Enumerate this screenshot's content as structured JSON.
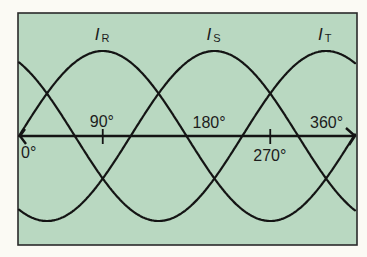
{
  "diagram": {
    "colors": {
      "background": "#fbfaf4",
      "panel": "#b9d8c1",
      "line": "#141414",
      "text": "#1c1c1c"
    },
    "axis": {
      "unit": "°",
      "degree_symbol": "°",
      "range_deg": [
        0,
        360
      ],
      "ticks": [
        {
          "deg": 0,
          "label": "0°",
          "label_pos": "below"
        },
        {
          "deg": 90,
          "label": "90°",
          "label_pos": "above"
        },
        {
          "deg": 180,
          "label": "180°",
          "label_pos": "above"
        },
        {
          "deg": 270,
          "label": "270°",
          "label_pos": "below"
        },
        {
          "deg": 360,
          "label": "360°",
          "label_pos": "above"
        }
      ]
    },
    "currents": [
      {
        "symbol": "I",
        "subscript": "R",
        "phase_shift_deg": 0,
        "peak_deg": 90
      },
      {
        "symbol": "I",
        "subscript": "S",
        "phase_shift_deg": 120,
        "peak_deg": 210
      },
      {
        "symbol": "I",
        "subscript": "T",
        "phase_shift_deg": 240,
        "peak_deg": 330
      }
    ]
  }
}
